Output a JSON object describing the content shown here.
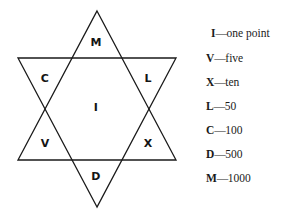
{
  "figure": {
    "star": {
      "shape": "hexagram",
      "stroke_color": "#1a1a1a",
      "fill_color": "#ffffff",
      "labels": [
        {
          "text": "M",
          "position": "top-point",
          "x": 96,
          "y": 42
        },
        {
          "text": "C",
          "position": "upper-left-point",
          "x": 45,
          "y": 78
        },
        {
          "text": "L",
          "position": "upper-right-point",
          "x": 148,
          "y": 78
        },
        {
          "text": "I",
          "position": "center",
          "x": 96,
          "y": 107
        },
        {
          "text": "V",
          "position": "lower-left-point",
          "x": 45,
          "y": 143
        },
        {
          "text": "X",
          "position": "lower-right-point",
          "x": 148,
          "y": 143
        },
        {
          "text": "D",
          "position": "bottom-point",
          "x": 96,
          "y": 176
        }
      ]
    },
    "legend": {
      "dash": "—",
      "entries": [
        {
          "symbol": "I",
          "meaning": "one point"
        },
        {
          "symbol": "V",
          "meaning": "five"
        },
        {
          "symbol": "X",
          "meaning": "ten"
        },
        {
          "symbol": "L",
          "meaning": "50"
        },
        {
          "symbol": "C",
          "meaning": "100"
        },
        {
          "symbol": "D",
          "meaning": "500"
        },
        {
          "symbol": "M",
          "meaning": "1000"
        }
      ]
    }
  }
}
